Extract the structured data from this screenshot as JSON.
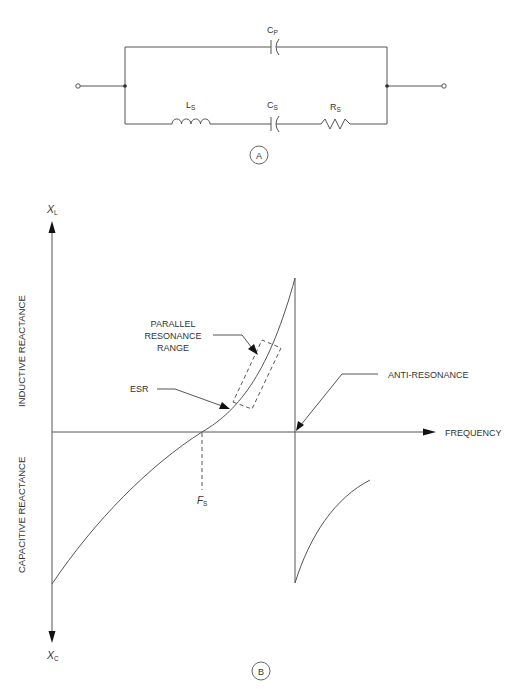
{
  "diagram_a": {
    "label": "A",
    "components": {
      "cp": {
        "label": "C",
        "sub": "P"
      },
      "ls": {
        "label": "L",
        "sub": "S"
      },
      "cs": {
        "label": "C",
        "sub": "S"
      },
      "rs": {
        "label": "R",
        "sub": "S"
      }
    }
  },
  "diagram_b": {
    "label": "B",
    "y_axis_top": {
      "label": "X",
      "sub": "L"
    },
    "y_axis_bottom": {
      "label": "X",
      "sub": "C"
    },
    "upper_axis_title": "INDUCTIVE REACTANCE",
    "lower_axis_title": "CAPACITIVE REACTANCE",
    "x_axis_title": "FREQUENCY",
    "annotations": {
      "parallel_line1": "PARALLEL",
      "parallel_line2": "RESONANCE",
      "parallel_line3": "RANGE",
      "esr": "ESR",
      "anti_resonance": "ANTI-RESONANCE",
      "fs": {
        "label": "F",
        "sub": "S"
      }
    }
  },
  "colors": {
    "line": "#555555",
    "text": "#333333",
    "background": "#ffffff"
  }
}
